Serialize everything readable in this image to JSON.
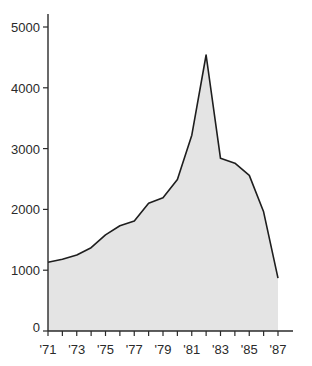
{
  "chart_data": {
    "type": "area",
    "title": "",
    "xlabel": "",
    "ylabel": "",
    "x": [
      1971,
      1972,
      1973,
      1974,
      1975,
      1976,
      1977,
      1978,
      1979,
      1980,
      1981,
      1982,
      1983,
      1984,
      1985,
      1986,
      1987
    ],
    "values": [
      1130,
      1180,
      1250,
      1370,
      1580,
      1730,
      1810,
      2100,
      2190,
      2490,
      3220,
      4540,
      2840,
      2760,
      2560,
      1960,
      870
    ],
    "x_tick_labels": [
      "'71",
      "'73",
      "'75",
      "'77",
      "'79",
      "'81",
      "'83",
      "'85",
      "'87"
    ],
    "x_tick_values": [
      1971,
      1973,
      1975,
      1977,
      1979,
      1981,
      1983,
      1985,
      1987
    ],
    "y_tick_labels": [
      "0",
      "1000",
      "2000",
      "3000",
      "4000",
      "5000"
    ],
    "y_tick_values": [
      0,
      1000,
      2000,
      3000,
      4000,
      5000
    ],
    "xlim": [
      1971,
      1987
    ],
    "ylim": [
      0,
      5000
    ],
    "grid": false,
    "legend": null,
    "colors": {
      "fill": "#e4e4e4",
      "line": "#1e1e1e",
      "axis": "#2a2a2a"
    }
  }
}
